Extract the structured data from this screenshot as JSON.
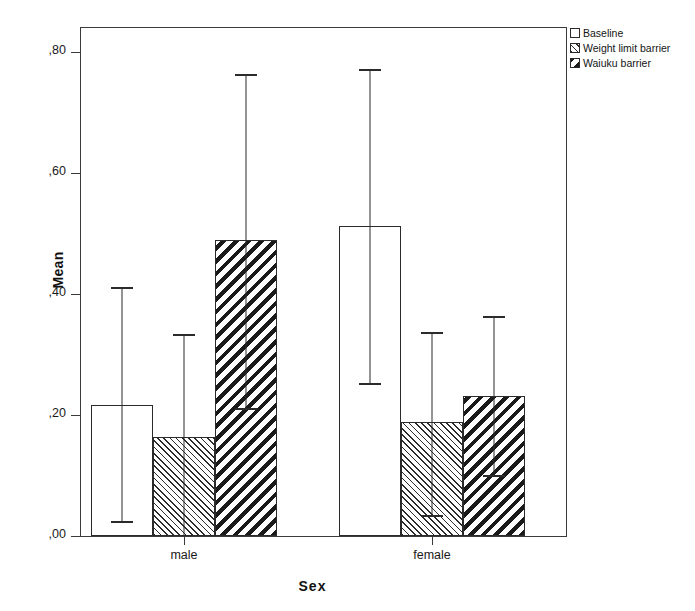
{
  "chart_data": {
    "type": "bar",
    "title": "",
    "xlabel": "Sex",
    "ylabel": "Mean",
    "categories": [
      "male",
      "female"
    ],
    "ylim": [
      0.0,
      0.85
    ],
    "yticks": [
      0.0,
      0.2,
      0.4,
      0.6,
      0.8
    ],
    "ytick_labels": [
      ",00",
      ",20",
      ",40",
      ",60",
      ",80"
    ],
    "grid": false,
    "legend_position": "top-right",
    "error_bars": "95% CI",
    "series": [
      {
        "name": "Baseline",
        "fill": "solid-white",
        "values": [
          0.217,
          0.512
        ],
        "ci_lower": [
          0.021,
          0.249
        ],
        "ci_upper": [
          0.41,
          0.77
        ]
      },
      {
        "name": "Weight limit barrier",
        "fill": "hatch-fine-45",
        "values": [
          0.164,
          0.188
        ],
        "ci_lower": [
          -0.005,
          0.032
        ],
        "ci_upper": [
          0.332,
          0.335
        ]
      },
      {
        "name": "Waiuku barrier",
        "fill": "hatch-bold-135",
        "values": [
          0.489,
          0.231
        ],
        "ci_lower": [
          0.208,
          0.098
        ],
        "ci_upper": [
          0.762,
          0.362
        ]
      }
    ]
  },
  "axes": {
    "y_label": "Mean",
    "x_label": "Sex",
    "y_tick_labels": [
      ",00",
      ",20",
      ",40",
      ",60",
      ",80"
    ],
    "x_tick_labels": [
      "male",
      "female"
    ]
  },
  "legend": {
    "items": [
      {
        "label": "Baseline",
        "fill": "solid-white"
      },
      {
        "label": "Weight limit barrier",
        "fill": "hatch-fine-45"
      },
      {
        "label": "Waiuku barrier",
        "fill": "hatch-bold-135"
      }
    ]
  },
  "colors": {
    "line": "#2b2b2b",
    "background": "#ffffff",
    "text": "#1a1a1a"
  }
}
